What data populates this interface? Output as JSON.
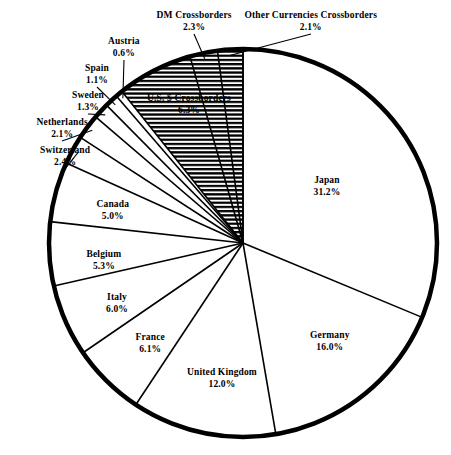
{
  "chart_data": {
    "type": "pie",
    "title": "",
    "subtitle": "",
    "xlabel": "",
    "ylabel": "",
    "legend_position": "none",
    "grid": false,
    "units": "percent",
    "start_angle_deg": 0,
    "direction": "clockwise",
    "categories": [
      "Japan",
      "Germany",
      "United Kingdom",
      "France",
      "Italy",
      "Belgium",
      "Canada",
      "Switzerland",
      "Netherlands",
      "Sweden",
      "Spain",
      "Austria",
      "U.S. $ Crossborders",
      "DM Crossborders",
      "Other Currencies Crossborders"
    ],
    "values": [
      31.2,
      16.0,
      12.0,
      6.1,
      6.0,
      5.3,
      5.0,
      2.4,
      2.1,
      1.3,
      1.1,
      0.6,
      6.3,
      2.3,
      2.1
    ],
    "total": 99.5,
    "slices": [
      {
        "label": "Japan",
        "value": 31.2,
        "value_text": "31.2%",
        "fill": "none",
        "label_x": 327,
        "label_y": 175,
        "align": "ctr",
        "leader": false
      },
      {
        "label": "Germany",
        "value": 16.0,
        "value_text": "16.0%",
        "fill": "none",
        "label_x": 330,
        "label_y": 330,
        "align": "ctr",
        "leader": false
      },
      {
        "label": "United Kingdom",
        "value": 12.0,
        "value_text": "12.0%",
        "fill": "none",
        "label_x": 222,
        "label_y": 367,
        "align": "ctr",
        "leader": false
      },
      {
        "label": "France",
        "value": 6.1,
        "value_text": "6.1%",
        "fill": "none",
        "label_x": 150,
        "label_y": 332,
        "align": "ctr",
        "leader": false
      },
      {
        "label": "Italy",
        "value": 6.0,
        "value_text": "6.0%",
        "fill": "none",
        "label_x": 117,
        "label_y": 292,
        "align": "ctr",
        "leader": false
      },
      {
        "label": "Belgium",
        "value": 5.3,
        "value_text": "5.3%",
        "fill": "none",
        "label_x": 104,
        "label_y": 249,
        "align": "ctr",
        "leader": false
      },
      {
        "label": "Canada",
        "value": 5.0,
        "value_text": "5.0%",
        "fill": "none",
        "label_x": 113,
        "label_y": 199,
        "align": "ctr",
        "leader": false
      },
      {
        "label": "Switzerland",
        "value": 2.4,
        "value_text": "2.4%",
        "fill": "none",
        "label_x": 65,
        "label_y": 145,
        "align": "ctr",
        "leader": true
      },
      {
        "label": "Netherlands",
        "value": 2.1,
        "value_text": "2.1%",
        "fill": "none",
        "label_x": 62,
        "label_y": 117,
        "align": "ctr",
        "leader": true
      },
      {
        "label": "Sweden",
        "value": 1.3,
        "value_text": "1.3%",
        "fill": "none",
        "label_x": 88,
        "label_y": 90,
        "align": "ctr",
        "leader": true
      },
      {
        "label": "Spain",
        "value": 1.1,
        "value_text": "1.1%",
        "fill": "none",
        "label_x": 97,
        "label_y": 63,
        "align": "ctr",
        "leader": true
      },
      {
        "label": "Austria",
        "value": 0.6,
        "value_text": "0.6%",
        "fill": "none",
        "label_x": 124,
        "label_y": 36,
        "align": "ctr",
        "leader": true
      },
      {
        "label": "U.S. $ Crossborders",
        "value": 6.3,
        "value_text": "6.3%",
        "fill": "hatched",
        "label_x": 189,
        "label_y": 93,
        "align": "ctr",
        "leader": false
      },
      {
        "label": "DM Crossborders",
        "value": 2.3,
        "value_text": "2.3%",
        "fill": "hatched",
        "label_x": 194,
        "label_y": 10,
        "align": "ctr",
        "leader": true
      },
      {
        "label": "Other Currencies Crossborders",
        "value": 2.1,
        "value_text": "2.1%",
        "fill": "hatched",
        "label_x": 311,
        "label_y": 10,
        "align": "ctr",
        "leader": true
      }
    ],
    "colors": {
      "outline": "#000000",
      "background": "#ffffff",
      "hatch": "#000000",
      "slice_fill": "#ffffff",
      "text": "#000000"
    },
    "geometry": {
      "center_x": 243,
      "center_y": 243,
      "radius": 194,
      "outline_width": 4.5,
      "divider_width": 1.6
    }
  }
}
